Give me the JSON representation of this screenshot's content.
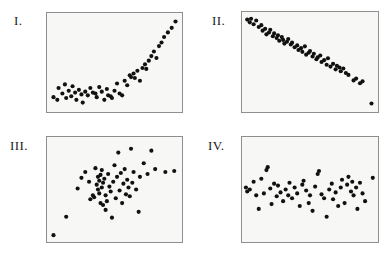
{
  "figure": {
    "background_color": "#ffffff",
    "panel_fill_color": "#f7f7f5",
    "panel_border_color": "#8e8e8e",
    "dot_color": "#111111",
    "dot_radius_px": 2.1
  },
  "panels": [
    {
      "id": "panel-i",
      "label": "I.",
      "label_x": 14,
      "label_y": 14,
      "frame": {
        "x": 46,
        "y": 12,
        "w": 137,
        "h": 101
      },
      "pattern": "strong positive curvilinear",
      "n_points": 52,
      "chart_data": {
        "type": "scatter",
        "title": "I.",
        "xlabel": "",
        "ylabel": "",
        "xlim": [
          0,
          100
        ],
        "ylim": [
          0,
          100
        ],
        "grid": false,
        "legend": "none",
        "points": [
          [
            2,
            12
          ],
          [
            5,
            9
          ],
          [
            6,
            22
          ],
          [
            9,
            16
          ],
          [
            11,
            26
          ],
          [
            12,
            11
          ],
          [
            14,
            19
          ],
          [
            16,
            13
          ],
          [
            17,
            24
          ],
          [
            19,
            17
          ],
          [
            20,
            9
          ],
          [
            22,
            20
          ],
          [
            24,
            15
          ],
          [
            25,
            6
          ],
          [
            27,
            18
          ],
          [
            29,
            14
          ],
          [
            31,
            22
          ],
          [
            33,
            17
          ],
          [
            35,
            16
          ],
          [
            36,
            12
          ],
          [
            38,
            23
          ],
          [
            40,
            18
          ],
          [
            42,
            9
          ],
          [
            44,
            21
          ],
          [
            45,
            14
          ],
          [
            47,
            13
          ],
          [
            48,
            11
          ],
          [
            50,
            19
          ],
          [
            52,
            27
          ],
          [
            54,
            16
          ],
          [
            56,
            14
          ],
          [
            58,
            30
          ],
          [
            60,
            25
          ],
          [
            62,
            36
          ],
          [
            63,
            34
          ],
          [
            65,
            38
          ],
          [
            66,
            33
          ],
          [
            68,
            41
          ],
          [
            70,
            30
          ],
          [
            72,
            44
          ],
          [
            74,
            48
          ],
          [
            75,
            43
          ],
          [
            77,
            52
          ],
          [
            79,
            57
          ],
          [
            81,
            62
          ],
          [
            83,
            55
          ],
          [
            85,
            68
          ],
          [
            87,
            72
          ],
          [
            89,
            78
          ],
          [
            92,
            83
          ],
          [
            95,
            88
          ],
          [
            98,
            95
          ]
        ]
      }
    },
    {
      "id": "panel-ii",
      "label": "II.",
      "label_x": 212,
      "label_y": 14,
      "frame": {
        "x": 241,
        "y": 11,
        "w": 138,
        "h": 102
      },
      "pattern": "strong negative linear",
      "n_points": 56,
      "chart_data": {
        "type": "scatter",
        "title": "II.",
        "xlabel": "",
        "ylabel": "",
        "xlim": [
          0,
          100
        ],
        "ylim": [
          0,
          100
        ],
        "grid": false,
        "legend": "none",
        "points": [
          [
            1,
            96
          ],
          [
            3,
            93
          ],
          [
            4,
            97
          ],
          [
            6,
            91
          ],
          [
            8,
            95
          ],
          [
            10,
            88
          ],
          [
            12,
            90
          ],
          [
            13,
            84
          ],
          [
            15,
            86
          ],
          [
            16,
            80
          ],
          [
            18,
            82
          ],
          [
            19,
            85
          ],
          [
            21,
            78
          ],
          [
            22,
            81
          ],
          [
            24,
            76
          ],
          [
            25,
            79
          ],
          [
            26,
            73
          ],
          [
            28,
            77
          ],
          [
            29,
            74
          ],
          [
            30,
            70
          ],
          [
            32,
            72
          ],
          [
            33,
            75
          ],
          [
            35,
            69
          ],
          [
            36,
            71
          ],
          [
            38,
            66
          ],
          [
            40,
            68
          ],
          [
            41,
            63
          ],
          [
            43,
            65
          ],
          [
            44,
            61
          ],
          [
            46,
            67
          ],
          [
            47,
            58
          ],
          [
            49,
            60
          ],
          [
            50,
            62
          ],
          [
            52,
            56
          ],
          [
            53,
            59
          ],
          [
            55,
            53
          ],
          [
            56,
            55
          ],
          [
            58,
            57
          ],
          [
            59,
            50
          ],
          [
            61,
            52
          ],
          [
            63,
            47
          ],
          [
            64,
            54
          ],
          [
            66,
            45
          ],
          [
            68,
            48
          ],
          [
            70,
            42
          ],
          [
            71,
            46
          ],
          [
            73,
            44
          ],
          [
            74,
            40
          ],
          [
            76,
            43
          ],
          [
            78,
            38
          ],
          [
            80,
            36
          ],
          [
            84,
            30
          ],
          [
            86,
            32
          ],
          [
            89,
            27
          ],
          [
            91,
            29
          ],
          [
            98,
            5
          ]
        ]
      }
    },
    {
      "id": "panel-iii",
      "label": "III.",
      "label_x": 10,
      "label_y": 139,
      "frame": {
        "x": 46,
        "y": 136,
        "w": 137,
        "h": 107
      },
      "pattern": "weak positive / diffuse cloud",
      "n_points": 54,
      "chart_data": {
        "type": "scatter",
        "title": "III.",
        "xlabel": "",
        "ylabel": "",
        "xlim": [
          0,
          100
        ],
        "ylim": [
          0,
          100
        ],
        "grid": false,
        "legend": "none",
        "points": [
          [
            2,
            3
          ],
          [
            12,
            22
          ],
          [
            21,
            51
          ],
          [
            24,
            62
          ],
          [
            27,
            68
          ],
          [
            30,
            58
          ],
          [
            31,
            40
          ],
          [
            33,
            44
          ],
          [
            34,
            42
          ],
          [
            35,
            72
          ],
          [
            36,
            55
          ],
          [
            37,
            50
          ],
          [
            37,
            63
          ],
          [
            38,
            46
          ],
          [
            38,
            59
          ],
          [
            39,
            36
          ],
          [
            39,
            65
          ],
          [
            40,
            70
          ],
          [
            40,
            52
          ],
          [
            41,
            34
          ],
          [
            41,
            57
          ],
          [
            42,
            61
          ],
          [
            43,
            44
          ],
          [
            43,
            29
          ],
          [
            44,
            38
          ],
          [
            45,
            66
          ],
          [
            46,
            53
          ],
          [
            47,
            48
          ],
          [
            48,
            21
          ],
          [
            49,
            58
          ],
          [
            50,
            75
          ],
          [
            51,
            41
          ],
          [
            52,
            63
          ],
          [
            53,
            88
          ],
          [
            54,
            49
          ],
          [
            55,
            67
          ],
          [
            56,
            36
          ],
          [
            57,
            56
          ],
          [
            58,
            71
          ],
          [
            59,
            45
          ],
          [
            60,
            60
          ],
          [
            61,
            52
          ],
          [
            62,
            43
          ],
          [
            63,
            92
          ],
          [
            64,
            57
          ],
          [
            65,
            68
          ],
          [
            67,
            50
          ],
          [
            69,
            27
          ],
          [
            70,
            63
          ],
          [
            73,
            77
          ],
          [
            76,
            66
          ],
          [
            79,
            90
          ],
          [
            82,
            71
          ],
          [
            90,
            68
          ],
          [
            97,
            69
          ]
        ]
      }
    },
    {
      "id": "panel-iv",
      "label": "IV.",
      "label_x": 208,
      "label_y": 139,
      "frame": {
        "x": 241,
        "y": 136,
        "w": 138,
        "h": 107
      },
      "pattern": "no correlation / horizontal band",
      "n_points": 55,
      "chart_data": {
        "type": "scatter",
        "title": "IV.",
        "xlabel": "",
        "ylabel": "",
        "xlim": [
          0,
          100
        ],
        "ylim": [
          0,
          100
        ],
        "grid": false,
        "legend": "none",
        "points": [
          [
            0,
            52
          ],
          [
            1,
            48
          ],
          [
            3,
            50
          ],
          [
            6,
            58
          ],
          [
            8,
            44
          ],
          [
            10,
            30
          ],
          [
            12,
            61
          ],
          [
            14,
            46
          ],
          [
            16,
            70
          ],
          [
            17,
            73
          ],
          [
            19,
            51
          ],
          [
            20,
            35
          ],
          [
            22,
            56
          ],
          [
            24,
            43
          ],
          [
            25,
            54
          ],
          [
            27,
            47
          ],
          [
            29,
            38
          ],
          [
            31,
            50
          ],
          [
            33,
            44
          ],
          [
            34,
            57
          ],
          [
            36,
            41
          ],
          [
            38,
            52
          ],
          [
            40,
            46
          ],
          [
            42,
            33
          ],
          [
            44,
            55
          ],
          [
            45,
            59
          ],
          [
            47,
            49
          ],
          [
            49,
            36
          ],
          [
            50,
            44
          ],
          [
            52,
            28
          ],
          [
            54,
            53
          ],
          [
            56,
            66
          ],
          [
            57,
            69
          ],
          [
            59,
            45
          ],
          [
            61,
            41
          ],
          [
            63,
            22
          ],
          [
            65,
            50
          ],
          [
            67,
            56
          ],
          [
            68,
            40
          ],
          [
            70,
            47
          ],
          [
            72,
            33
          ],
          [
            74,
            52
          ],
          [
            75,
            60
          ],
          [
            77,
            36
          ],
          [
            79,
            55
          ],
          [
            80,
            63
          ],
          [
            82,
            48
          ],
          [
            83,
            58
          ],
          [
            84,
            44
          ],
          [
            86,
            52
          ],
          [
            87,
            30
          ],
          [
            89,
            57
          ],
          [
            91,
            46
          ],
          [
            93,
            38
          ],
          [
            99,
            62
          ]
        ]
      }
    }
  ]
}
